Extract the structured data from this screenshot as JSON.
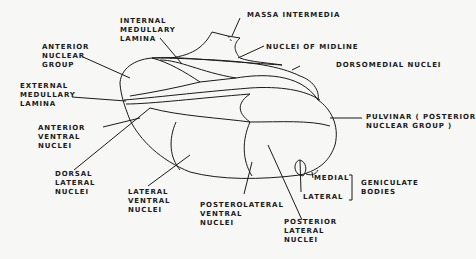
{
  "diagram": {
    "labels": {
      "internal_medullary_lamina": [
        "INTERNAL",
        "MEDULLARY",
        "LAMINA"
      ],
      "massa_intermedia": "MASSA INTERMEDIA",
      "anterior_nuclear_group": [
        "ANTERIOR",
        "NUCLEAR",
        "GROUP"
      ],
      "nuclei_of_midline": "NUCLEI OF MIDLINE",
      "dorsomedial_nuclei": "DORSOMEDIAL NUCLEI",
      "external_medullary_lamina": [
        "EXTERNAL",
        "MEDULLARY",
        "LAMINA"
      ],
      "anterior_ventral_nuclei": [
        "ANTERIOR",
        "VENTRAL",
        "NUCLEI"
      ],
      "pulvinar": [
        "PULVINAR ( POSTERIOR",
        "NUCLEAR GROUP )"
      ],
      "dorsal_lateral_nuclei": [
        "DORSAL",
        "LATERAL",
        "NUCLEI"
      ],
      "lateral_ventral_nuclei": [
        "LATERAL",
        "VENTRAL",
        "NUCLEI"
      ],
      "posterolateral_ventral_nuclei": [
        "POSTEROLATERAL",
        "VENTRAL",
        "NUCLEI"
      ],
      "posterior_lateral_nuclei": [
        "POSTERIOR",
        "LATERAL",
        "NUCLEI"
      ],
      "medial": "MEDIAL",
      "lateral": "LATERAL",
      "geniculate_bodies": [
        "GENICULATE",
        "BODIES"
      ]
    },
    "colors": {
      "line": "#1a1a1a",
      "background": "#f7f7f6"
    }
  }
}
